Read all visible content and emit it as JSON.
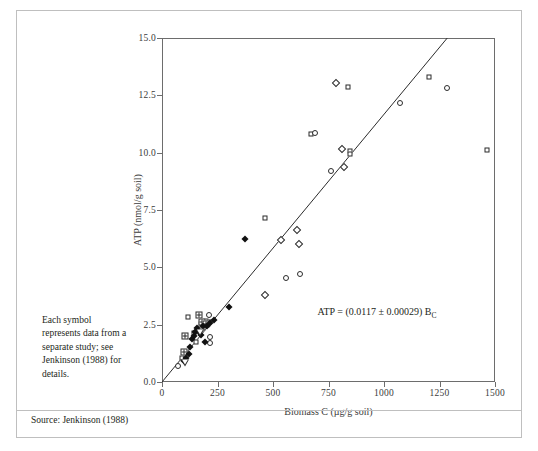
{
  "figure": {
    "caption_note": "Each symbol represents data from a separate study; see Jenkinson (1988) for details.",
    "source": "Source: Jenkinson (1988)"
  },
  "chart_data": {
    "type": "scatter",
    "title": "",
    "xlabel": "Biomass C (µg/g soil)",
    "ylabel": "ATP (nmol/g soil)",
    "xlim": [
      0,
      1500
    ],
    "ylim": [
      0.0,
      15.0
    ],
    "xticks": [
      0,
      250,
      500,
      750,
      1000,
      1250,
      1500
    ],
    "xtick_labels": [
      "0",
      "250",
      "500",
      "750",
      "1000",
      "1250",
      "1500"
    ],
    "yticks": [
      0.0,
      2.5,
      5.0,
      7.5,
      10.0,
      12.5,
      15.0
    ],
    "ytick_labels": [
      "0.0",
      "2.5",
      "5.0",
      "7.5",
      "10.0",
      "12.5",
      "15.0"
    ],
    "grid": false,
    "legend": null,
    "annotation": {
      "text": "ATP = (0.0117 ± 0.00029) B",
      "subscript": "C",
      "x": 700,
      "y": 3.0
    },
    "fit_line": {
      "type": "linear-through-origin",
      "slope": 0.0117,
      "slope_error": 0.00029,
      "intercept": 0.0,
      "x_start": 0,
      "y_start": 0.0,
      "x_end": 1285,
      "y_end": 15.0
    },
    "series": [
      {
        "name": "study-open-square",
        "marker": "open-square",
        "points": [
          [
            118,
            2.82
          ],
          [
            146,
            2.14
          ],
          [
            152,
            1.73
          ],
          [
            176,
            2.54
          ],
          [
            183,
            2.36
          ],
          [
            196,
            2.66
          ],
          [
            213,
            2.62
          ],
          [
            92,
            1.05
          ],
          [
            466,
            7.13
          ],
          [
            672,
            10.82
          ],
          [
            838,
            12.88
          ],
          [
            846,
            10.06
          ],
          [
            848,
            9.96
          ],
          [
            1202,
            13.28
          ],
          [
            1462,
            10.1
          ]
        ]
      },
      {
        "name": "study-crossed-square",
        "marker": "crossed-square",
        "points": [
          [
            97,
            1.32
          ],
          [
            104,
            2.0
          ],
          [
            166,
            2.9
          ],
          [
            182,
            2.62
          ],
          [
            196,
            2.52
          ]
        ]
      },
      {
        "name": "study-open-circle",
        "marker": "open-circle",
        "points": [
          [
            74,
            0.7
          ],
          [
            214,
            1.96
          ],
          [
            216,
            1.72
          ],
          [
            212,
            2.9
          ],
          [
            560,
            4.52
          ],
          [
            622,
            4.72
          ],
          [
            690,
            10.86
          ],
          [
            760,
            9.22
          ],
          [
            1072,
            12.18
          ],
          [
            1282,
            12.8
          ]
        ]
      },
      {
        "name": "study-open-diamond",
        "marker": "open-diamond",
        "points": [
          [
            466,
            3.78
          ],
          [
            534,
            6.18
          ],
          [
            610,
            6.62
          ],
          [
            618,
            6.02
          ],
          [
            782,
            13.04
          ],
          [
            812,
            10.16
          ],
          [
            818,
            9.38
          ]
        ]
      },
      {
        "name": "study-filled-diamond",
        "marker": "filled-diamond",
        "points": [
          [
            100,
            0.92
          ],
          [
            110,
            1.06
          ],
          [
            120,
            1.24
          ],
          [
            126,
            1.52
          ],
          [
            134,
            1.88
          ],
          [
            142,
            2.02
          ],
          [
            150,
            2.18
          ],
          [
            158,
            2.34
          ],
          [
            168,
            2.2
          ],
          [
            176,
            2.06
          ],
          [
            186,
            2.44
          ],
          [
            192,
            1.74
          ],
          [
            204,
            2.46
          ],
          [
            216,
            2.58
          ],
          [
            232,
            2.72
          ],
          [
            300,
            3.26
          ],
          [
            372,
            6.24
          ]
        ]
      },
      {
        "name": "study-open-triangle",
        "marker": "open-triangle",
        "points": [
          [
            104,
            0.82
          ],
          [
            172,
            2.44
          ]
        ]
      }
    ]
  }
}
